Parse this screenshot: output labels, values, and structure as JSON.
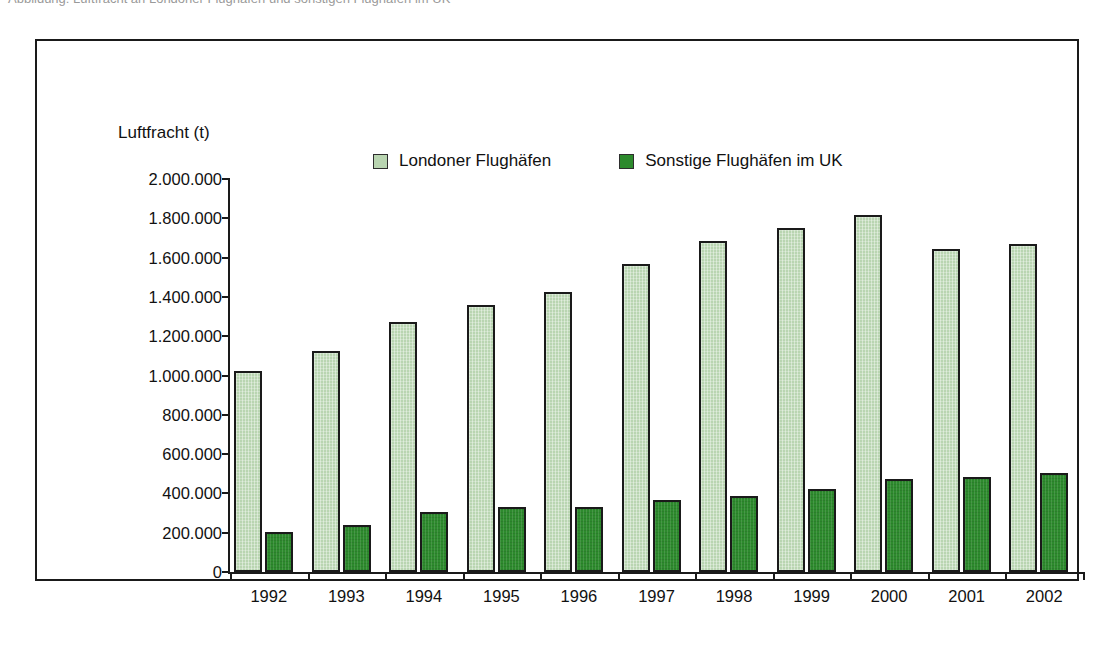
{
  "top_caption": {
    "text": "Abbildung: Luftfracht an Londoner Flughäfen und sonstigen Flughäfen im UK"
  },
  "figure": {
    "axis_title": "Luftfracht (t)"
  },
  "legend": {
    "items": [
      {
        "label": "Londoner Flughäfen",
        "color": "#b9d5b1",
        "name": "legend-london"
      },
      {
        "label": "Sonstige Flughäfen im UK",
        "color": "#2d8a2d",
        "name": "legend-other"
      }
    ]
  },
  "chart_data": {
    "type": "bar",
    "title": "",
    "subtitle": "",
    "xlabel": "",
    "ylabel": "Luftfracht (t)",
    "ylim": [
      0,
      2000000
    ],
    "ytick_step": 200000,
    "ytick_labels": [
      "2.000.000",
      "1.800.000",
      "1.600.000",
      "1.400.000",
      "1.200.000",
      "1.000.000",
      "800.000",
      "600.000",
      "400.000",
      "200.000",
      "0"
    ],
    "ytick_values": [
      2000000,
      1800000,
      1600000,
      1400000,
      1200000,
      1000000,
      800000,
      600000,
      400000,
      200000,
      0
    ],
    "categories": [
      "1992",
      "1993",
      "1994",
      "1995",
      "1996",
      "1997",
      "1998",
      "1999",
      "2000",
      "2001",
      "2002"
    ],
    "series": [
      {
        "name": "Londoner Flughäfen",
        "color": "#b9d5b1",
        "values": [
          1025000,
          1125000,
          1270000,
          1360000,
          1425000,
          1570000,
          1685000,
          1750000,
          1815000,
          1645000,
          1670000
        ]
      },
      {
        "name": "Sonstige Flughäfen im UK",
        "color": "#2d8a2d",
        "values": [
          205000,
          240000,
          305000,
          330000,
          330000,
          365000,
          385000,
          420000,
          475000,
          483000,
          503000
        ]
      }
    ],
    "grid": false,
    "legend_position": "top"
  }
}
